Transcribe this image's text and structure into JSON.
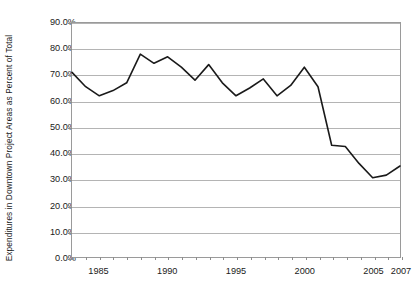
{
  "chart_data": {
    "type": "line",
    "title": "",
    "xlabel": "",
    "ylabel": "Expenditures in Downtown Project Areas as Percent of Total",
    "x": [
      1983,
      1984,
      1985,
      1986,
      1987,
      1988,
      1989,
      1990,
      1991,
      1992,
      1993,
      1994,
      1995,
      1996,
      1997,
      1998,
      1999,
      2000,
      2001,
      2002,
      2003,
      2004,
      2005,
      2006,
      2007
    ],
    "values": [
      71.0,
      65.5,
      62.0,
      64.0,
      67.0,
      78.0,
      74.5,
      77.0,
      73.0,
      68.0,
      74.0,
      67.0,
      62.0,
      65.0,
      68.5,
      62.0,
      66.0,
      73.0,
      65.5,
      43.0,
      42.5,
      36.0,
      30.5,
      31.5,
      35.0
    ],
    "series": [
      {
        "name": "Expenditures in Downtown Project Areas as Percent of Total",
        "values": [
          71.0,
          65.5,
          62.0,
          64.0,
          67.0,
          78.0,
          74.5,
          77.0,
          73.0,
          68.0,
          74.0,
          67.0,
          62.0,
          65.0,
          68.5,
          62.0,
          66.0,
          73.0,
          65.5,
          43.0,
          42.5,
          36.0,
          30.5,
          31.5,
          35.0
        ]
      }
    ],
    "ylim": [
      0,
      90
    ],
    "xlim": [
      1983,
      2007
    ],
    "ytick_values": [
      0,
      10,
      20,
      30,
      40,
      50,
      60,
      70,
      80,
      90
    ],
    "ytick_labels": [
      "0.0%",
      "10.0%",
      "20.0%",
      "30.0%",
      "40.0%",
      "50.0%",
      "60.0%",
      "70.0%",
      "80.0%",
      "90.0%"
    ],
    "xtick_values": [
      1985,
      1990,
      1995,
      2000,
      2005,
      2007
    ],
    "xtick_labels": [
      "1985",
      "1990",
      "1995",
      "2000",
      "2005",
      "2007"
    ],
    "grid": "horizontal",
    "legend": "none",
    "line_color": "#1a1a1a",
    "grid_color": "#b4b4b4",
    "axis_color": "#9a9a9a",
    "background_color": "#ffffff"
  }
}
